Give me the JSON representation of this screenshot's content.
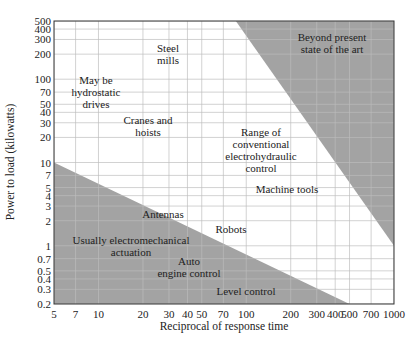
{
  "chart_data": {
    "type": "area",
    "title": "",
    "xlabel": "Reciprocal of response time",
    "ylabel": "Power to load (kilowatts)",
    "x_scale": "log",
    "y_scale": "log",
    "xlim": [
      5,
      1000
    ],
    "ylim": [
      0.2,
      500
    ],
    "grid": true,
    "x_ticks": [
      5,
      7,
      10,
      20,
      30,
      40,
      50,
      70,
      100,
      200,
      300,
      400,
      500,
      700,
      1000
    ],
    "x_tick_labels": [
      "5",
      "7",
      "10",
      "20",
      "30",
      "40",
      50,
      "70",
      "100",
      "200",
      "300",
      "400",
      "500",
      "700",
      "1000"
    ],
    "y_ticks": [
      0.2,
      0.3,
      0.4,
      0.5,
      0.7,
      1,
      2,
      3,
      4,
      5,
      7,
      10,
      20,
      30,
      40,
      50,
      70,
      100,
      200,
      300,
      400,
      500
    ],
    "y_tick_labels": [
      "0.2",
      "0.3",
      "0.4",
      "0.5",
      "0.7",
      "1",
      "2",
      "3",
      "4",
      "5",
      "7",
      "10",
      "20",
      "30",
      "40",
      "50",
      "70",
      "100",
      "200",
      "300",
      "400",
      "500"
    ],
    "regions": [
      {
        "name": "Beyond present state of the art",
        "shaded": true,
        "boundary": [
          [
            85,
            500
          ],
          [
            1000,
            1
          ]
        ],
        "description": "Upper-right shaded region"
      },
      {
        "name": "Usually electromechanical actuation",
        "shaded": true,
        "boundary": [
          [
            5,
            10
          ],
          [
            500,
            0.2
          ]
        ],
        "description": "Lower-left shaded region"
      },
      {
        "name": "Range of conventional electrohydraulic control",
        "shaded": false,
        "description": "Unshaded band between the two shaded regions"
      }
    ],
    "annotations": [
      {
        "text": "Beyond present state of the art",
        "x": 500,
        "y": 300
      },
      {
        "text": "Steel mills",
        "x": 30,
        "y": 200
      },
      {
        "text": "May be hydrostatic drives",
        "x": 9,
        "y": 70
      },
      {
        "text": "Cranes and hoists",
        "x": 25,
        "y": 25
      },
      {
        "text": "Range of conventional electrohydraulic control",
        "x": 150,
        "y": 12
      },
      {
        "text": "Machine tools",
        "x": 200,
        "y": 5
      },
      {
        "text": "Antennas",
        "x": 30,
        "y": 2
      },
      {
        "text": "Robots",
        "x": 70,
        "y": 1.2
      },
      {
        "text": "Usually electromechanical actuation",
        "x": 15,
        "y": 0.8
      },
      {
        "text": "Auto engine control",
        "x": 50,
        "y": 0.5
      },
      {
        "text": "Level control",
        "x": 100,
        "y": 0.25
      }
    ]
  },
  "labels": {
    "beyond_1": "Beyond present",
    "beyond_2": "state of the art",
    "steel_1": "Steel",
    "steel_2": "mills",
    "hydro_1": "May be",
    "hydro_2": "hydrostatic",
    "hydro_3": "drives",
    "cranes_1": "Cranes and",
    "cranes_2": "hoists",
    "range_1": "Range of",
    "range_2": "conventional",
    "range_3": "electrohydraulic",
    "range_4": "control",
    "machine": "Machine tools",
    "antennas": "Antennas",
    "robots": "Robots",
    "usually_1": "Usually electromechanical",
    "usually_2": "actuation",
    "auto_1": "Auto",
    "auto_2": "engine control",
    "level": "Level control"
  },
  "colors": {
    "shade": "#a3a3a3",
    "grid": "#bdbdbd",
    "grid_on_shade": "#8c8c8c",
    "frame": "#333333"
  }
}
